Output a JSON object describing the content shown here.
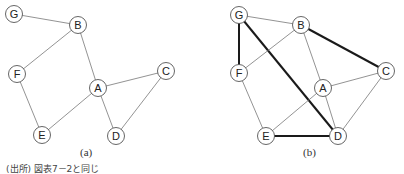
{
  "figure": {
    "caption_a": "(a)",
    "caption_b": "(b)",
    "source_note": "(出所) 図表7－2と同じ"
  },
  "graphs": [
    {
      "id": "a",
      "nodes": [
        {
          "label": "G",
          "x": 14,
          "y": 14
        },
        {
          "label": "B",
          "x": 78,
          "y": 25
        },
        {
          "label": "F",
          "x": 17,
          "y": 74
        },
        {
          "label": "A",
          "x": 98,
          "y": 88
        },
        {
          "label": "C",
          "x": 166,
          "y": 71
        },
        {
          "label": "E",
          "x": 42,
          "y": 135
        },
        {
          "label": "D",
          "x": 116,
          "y": 136
        }
      ],
      "edges": [
        {
          "from": "G",
          "to": "B",
          "bold": false
        },
        {
          "from": "B",
          "to": "F",
          "bold": false
        },
        {
          "from": "B",
          "to": "A",
          "bold": false
        },
        {
          "from": "F",
          "to": "E",
          "bold": false
        },
        {
          "from": "A",
          "to": "E",
          "bold": false
        },
        {
          "from": "A",
          "to": "C",
          "bold": false
        },
        {
          "from": "A",
          "to": "D",
          "bold": false
        },
        {
          "from": "C",
          "to": "D",
          "bold": false
        }
      ]
    },
    {
      "id": "b",
      "nodes": [
        {
          "label": "G",
          "x": 239,
          "y": 15
        },
        {
          "label": "B",
          "x": 301,
          "y": 25
        },
        {
          "label": "F",
          "x": 239,
          "y": 73
        },
        {
          "label": "A",
          "x": 323,
          "y": 88
        },
        {
          "label": "C",
          "x": 386,
          "y": 71
        },
        {
          "label": "E",
          "x": 266,
          "y": 136
        },
        {
          "label": "D",
          "x": 338,
          "y": 136
        }
      ],
      "edges": [
        {
          "from": "G",
          "to": "B",
          "bold": false
        },
        {
          "from": "G",
          "to": "F",
          "bold": true
        },
        {
          "from": "G",
          "to": "D",
          "bold": true
        },
        {
          "from": "B",
          "to": "F",
          "bold": false
        },
        {
          "from": "B",
          "to": "A",
          "bold": false
        },
        {
          "from": "B",
          "to": "C",
          "bold": true
        },
        {
          "from": "F",
          "to": "E",
          "bold": false
        },
        {
          "from": "A",
          "to": "E",
          "bold": false
        },
        {
          "from": "A",
          "to": "C",
          "bold": false
        },
        {
          "from": "A",
          "to": "D",
          "bold": false
        },
        {
          "from": "C",
          "to": "D",
          "bold": false
        },
        {
          "from": "E",
          "to": "D",
          "bold": true
        }
      ]
    }
  ],
  "style": {
    "edge_color": "#777777",
    "bold_edge_color": "#1a1a1a",
    "node_stroke": "#555555",
    "node_fill": "#ffffff",
    "label_color": "#222222"
  }
}
